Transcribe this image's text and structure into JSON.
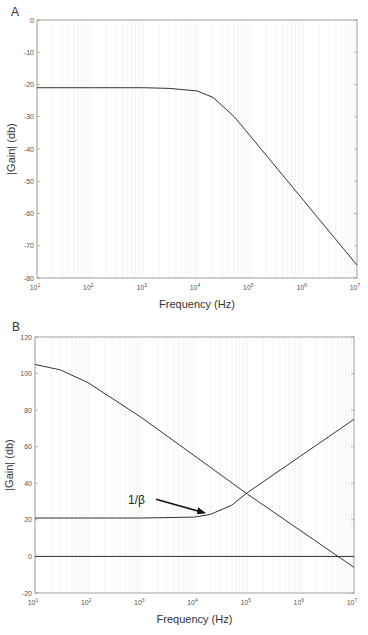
{
  "chart_data": [
    {
      "panel": "A",
      "type": "line",
      "title": "",
      "xlabel": "Frequency (Hz)",
      "ylabel": "|Gain| (db)",
      "xscale": "log",
      "xlim": [
        10,
        10000000
      ],
      "ylim": [
        -80,
        0
      ],
      "xticks": [
        "10^1",
        "10^2",
        "10^3",
        "10^4",
        "10^5",
        "10^6",
        "10^7"
      ],
      "yticks": [
        0,
        -10,
        -20,
        -30,
        -40,
        -50,
        -60,
        -70,
        -80
      ],
      "grid": "vertical log grid",
      "series": [
        {
          "name": "gain",
          "x": [
            10,
            100,
            1000,
            3000,
            10000,
            20000,
            50000,
            100000,
            1000000,
            10000000
          ],
          "y": [
            -21,
            -21,
            -21,
            -21.2,
            -22,
            -24,
            -30,
            -36,
            -56,
            -76
          ]
        }
      ]
    },
    {
      "panel": "B",
      "type": "line",
      "title": "",
      "xlabel": "Frequency (Hz)",
      "ylabel": "|Gain| (db)",
      "xscale": "log",
      "xlim": [
        10,
        10000000
      ],
      "ylim": [
        -20,
        120
      ],
      "xticks": [
        "10^1",
        "10^2",
        "10^3",
        "10^4",
        "10^5",
        "10^6",
        "10^7"
      ],
      "yticks": [
        120,
        100,
        80,
        60,
        40,
        20,
        0,
        -20
      ],
      "grid": "vertical log grid",
      "annotations": [
        {
          "text": "1/β",
          "arrow_to": {
            "x": 18000,
            "y": 22
          }
        }
      ],
      "series": [
        {
          "name": "open-loop gain",
          "x": [
            10,
            30,
            100,
            1000,
            10000,
            100000,
            1000000,
            5000000,
            10000000
          ],
          "y": [
            105,
            102,
            95,
            76,
            55,
            34,
            14,
            0,
            -6
          ]
        },
        {
          "name": "1/β",
          "x": [
            10,
            1000,
            10000,
            20000,
            50000,
            100000,
            1000000,
            10000000
          ],
          "y": [
            21,
            21,
            21.5,
            23,
            28,
            35,
            55,
            75
          ]
        },
        {
          "name": "0 dB",
          "x": [
            10,
            10000000
          ],
          "y": [
            0,
            0
          ]
        }
      ]
    }
  ],
  "panels": {
    "a": {
      "letter": "A",
      "xlabel": "Frequency (Hz)",
      "ylabel": "|Gain| (db)"
    },
    "b": {
      "letter": "B",
      "xlabel": "Frequency (Hz)",
      "ylabel": "|Gain| (db)",
      "annotation": "1/β"
    }
  },
  "colors": {
    "line": "#333333",
    "grid": "#d4d4d4",
    "axis": "#888888"
  }
}
